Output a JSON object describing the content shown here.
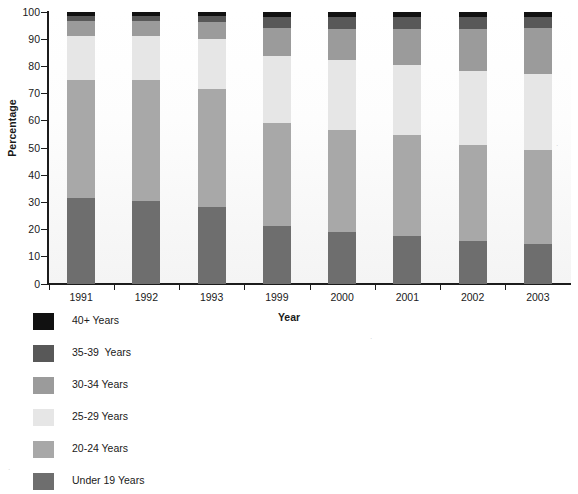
{
  "chart_data": {
    "type": "bar",
    "subtype": "stacked-bar-100-percent",
    "title": "",
    "xlabel": "Year",
    "ylabel": "Percentage",
    "ylim": [
      0,
      100
    ],
    "yticks": [
      0,
      10,
      20,
      30,
      40,
      50,
      60,
      70,
      80,
      90,
      100
    ],
    "grid": false,
    "legend_position": "below-left",
    "categories": [
      "1991",
      "1992",
      "1993",
      "1999",
      "2000",
      "2001",
      "2002",
      "2003"
    ],
    "series": [
      {
        "name": "Under 19 Years",
        "color": "#6e6e6e",
        "values": [
          31.5,
          30.5,
          28.0,
          21.0,
          19.0,
          17.5,
          15.5,
          14.5
        ]
      },
      {
        "name": "20-24 Years",
        "color": "#a8a8a8",
        "values": [
          43.5,
          44.5,
          43.5,
          38.0,
          37.5,
          37.0,
          35.5,
          34.5
        ]
      },
      {
        "name": "25-29 Years",
        "color": "#e6e6e6",
        "values": [
          16.0,
          16.0,
          18.5,
          24.5,
          25.5,
          26.0,
          27.0,
          28.0
        ]
      },
      {
        "name": "30-34 Years",
        "color": "#9b9b9b",
        "values": [
          5.5,
          5.5,
          6.0,
          10.5,
          11.5,
          13.0,
          15.5,
          17.0
        ]
      },
      {
        "name": "35-39  Years",
        "color": "#585858",
        "values": [
          2.0,
          2.0,
          2.5,
          4.0,
          4.5,
          4.5,
          4.5,
          4.0
        ]
      },
      {
        "name": "40+ Years",
        "color": "#111111",
        "values": [
          1.5,
          1.5,
          1.5,
          2.0,
          2.0,
          2.0,
          2.0,
          2.0
        ]
      }
    ]
  },
  "axes": {
    "y_title": "Percentage",
    "x_title": "Year",
    "y_tick_labels": [
      "100",
      "90",
      "80",
      "70",
      "60",
      "50",
      "40",
      "30",
      "20",
      "10",
      "0"
    ],
    "x_tick_labels": [
      "1991",
      "1992",
      "1993",
      "1999",
      "2000",
      "2001",
      "2002",
      "2003"
    ]
  },
  "legend": {
    "items": [
      {
        "label": "40+ Years",
        "color": "#111111"
      },
      {
        "label": "35-39  Years",
        "color": "#585858"
      },
      {
        "label": "30-34 Years",
        "color": "#9b9b9b"
      },
      {
        "label": "25-29 Years",
        "color": "#e6e6e6"
      },
      {
        "label": "20-24 Years",
        "color": "#a8a8a8"
      },
      {
        "label": "Under 19 Years",
        "color": "#6e6e6e"
      }
    ]
  }
}
